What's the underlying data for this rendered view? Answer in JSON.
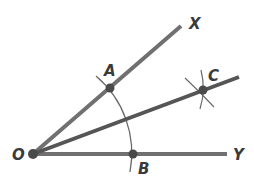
{
  "diagram": {
    "labels": {
      "vertex": "O",
      "point_a": "A",
      "point_b": "B",
      "point_c": "C",
      "ray_x": "X",
      "ray_y": "Y"
    },
    "colors": {
      "ray": "#6e6e6e",
      "bisector": "#555555",
      "arc": "#6a6a6a",
      "point": "#4a4a4a",
      "label": "#3a3a3a"
    }
  }
}
